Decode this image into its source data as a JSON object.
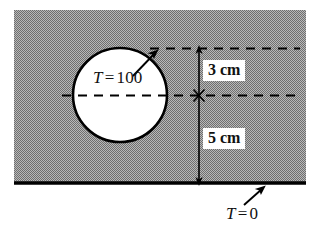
{
  "figure": {
    "name": "heat-conduction-cross-section",
    "colors": {
      "body_fill": "#9a9a9a",
      "hole_fill": "#ffffff",
      "outline": "#000000",
      "background": "#ffffff",
      "dimension_line": "#000000"
    }
  },
  "labels": {
    "hole_temperature": {
      "symbol": "T",
      "equals": "=",
      "value": "100",
      "full": "T = 100"
    },
    "plate_temperature": {
      "symbol": "T",
      "equals": "=",
      "value": "0",
      "full": "T = 0"
    }
  },
  "dimensions": {
    "upper": {
      "value": "3",
      "unit": "cm",
      "full": "3 cm",
      "meaning": "distance from hole centerline up to the top dashed reference line"
    },
    "lower": {
      "value": "5",
      "unit": "cm",
      "full": "5 cm",
      "meaning": "distance from hole centerline down to the bottom boundary"
    }
  },
  "geometry": {
    "body_rect": {
      "x": 14,
      "y": 10,
      "width": 292,
      "height": 173
    },
    "hole_circle": {
      "cx": 120,
      "cy": 95,
      "r": 48
    },
    "bottom_boundary_line": {
      "x1": 14,
      "y1": 183,
      "x2": 306,
      "y2": 183
    },
    "dimension_axis_x": 199,
    "top_reference_y": 48,
    "centerline_y": 95,
    "bottom_y": 183
  }
}
